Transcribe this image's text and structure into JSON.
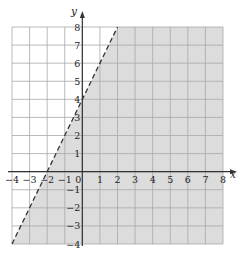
{
  "chart_data": {
    "type": "inequality-graph",
    "title": "",
    "xlabel": "x",
    "ylabel": "y",
    "xlim": [
      -4,
      8
    ],
    "ylim": [
      -4,
      8
    ],
    "grid": true,
    "x_ticks": [
      -4,
      -3,
      -2,
      -1,
      0,
      1,
      2,
      3,
      4,
      5,
      6,
      7,
      8
    ],
    "x_tick_labels": [
      "−4",
      "−3",
      "−2",
      "−1",
      "0",
      "1",
      "2",
      "3",
      "4",
      "5",
      "6",
      "7",
      "8"
    ],
    "y_ticks": [
      -4,
      -3,
      -2,
      -1,
      1,
      2,
      3,
      4,
      5,
      6,
      7,
      8
    ],
    "y_tick_labels": [
      "−4",
      "−3",
      "−2",
      "−1",
      "1",
      "2",
      "3",
      "4",
      "5",
      "6",
      "7",
      "8"
    ],
    "boundary_line": {
      "equation": "y = 2x + 4",
      "style": "dashed",
      "points": [
        [
          -4,
          -4
        ],
        [
          2,
          8
        ]
      ]
    },
    "shaded_region": {
      "description": "region to the right of / below the dashed line",
      "inequality": "y < 2x + 4",
      "polygon": [
        [
          -4,
          -4
        ],
        [
          2,
          8
        ],
        [
          8,
          8
        ],
        [
          8,
          -4
        ]
      ]
    },
    "colors": {
      "shade": "#dcdcdc",
      "grid": "#a8a8a8",
      "axis": "#333333",
      "line": "#333333"
    }
  }
}
